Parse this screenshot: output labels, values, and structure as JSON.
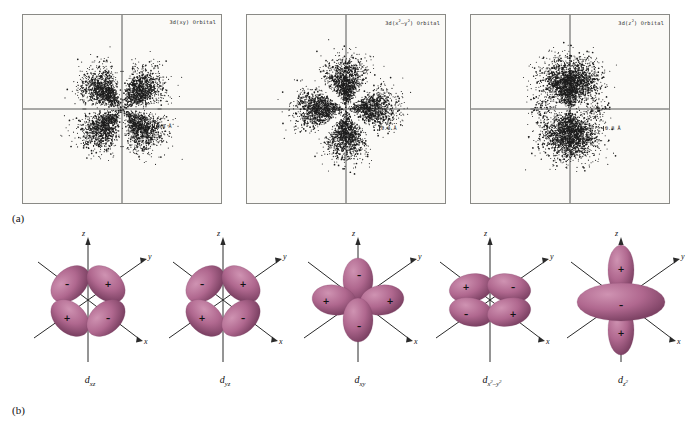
{
  "figure": {
    "panel_a_label": "(a)",
    "panel_b_label": "(b)"
  },
  "panel_a": {
    "plots": [
      {
        "name": "3d-xy-scatter",
        "title_prefix": "3d(xy) Orbital",
        "title_main": "3d(xy) Orbital",
        "scale_label": "0.8 Å",
        "orbital": "xy",
        "lobe_orientation": "diagonal",
        "description": "Electron density dot plot with four lobes between the axes"
      },
      {
        "name": "3d-x2-y2-scatter",
        "title_main": "3d(x",
        "title_sup": "2",
        "title_mid": "–y",
        "title_sup2": "2",
        "title_end": ") Orbital",
        "scale_label": "0.8 Å",
        "orbital": "x2-y2",
        "lobe_orientation": "axial",
        "description": "Electron density dot plot with four lobes along the axes"
      },
      {
        "name": "3d-z2-scatter",
        "title_main": "3d(z",
        "title_sup": "2",
        "title_end": ") Orbital",
        "scale_label": "0.8 Å",
        "orbital": "z2",
        "lobe_orientation": "vertical-with-ring",
        "description": "Electron density dot plot with two vertical lobes and an equatorial ring"
      }
    ]
  },
  "panel_b": {
    "axis_labels": {
      "x": "x",
      "y": "y",
      "z": "z"
    },
    "orbitals": [
      {
        "name": "d-xz",
        "label_base": "d",
        "label_sub": "xz",
        "signs": {
          "upper_left": "–",
          "upper_right": "+",
          "lower_left": "+",
          "lower_right": "–"
        },
        "style": "four-lobe-diagonal"
      },
      {
        "name": "d-yz",
        "label_base": "d",
        "label_sub": "yz",
        "signs": {
          "upper_left": "–",
          "upper_right": "+",
          "lower_left": "+",
          "lower_right": "–"
        },
        "style": "four-lobe-diagonal"
      },
      {
        "name": "d-xy",
        "label_base": "d",
        "label_sub": "xy",
        "signs": {
          "top": "–",
          "left": "+",
          "right": "+",
          "bottom": "–"
        },
        "style": "four-lobe-cross"
      },
      {
        "name": "d-x2-y2",
        "label_base": "d",
        "label_sub": "x",
        "label_sub_sup": "2",
        "label_sub_mid": "–y",
        "label_sub_sup2": "2",
        "signs": {
          "upper_left": "+",
          "upper_right": "–",
          "lower_left": "–",
          "lower_right": "+"
        },
        "style": "four-lobe-horizontal"
      },
      {
        "name": "d-z2",
        "label_base": "d",
        "label_sub": "z",
        "label_sub_sup": "2",
        "signs": {
          "top": "+",
          "ring": "–",
          "bottom": "+"
        },
        "style": "two-lobe-with-torus"
      }
    ]
  },
  "colors": {
    "lobe_fill": "#b0688f",
    "lobe_highlight": "#cf93b2",
    "lobe_shadow": "#7d4264",
    "panel_bg": "#fbfaf7",
    "panel_border": "#8a8a86",
    "axis": "#2a2a2a",
    "dot": "#1c1c1c",
    "text": "#111111"
  }
}
